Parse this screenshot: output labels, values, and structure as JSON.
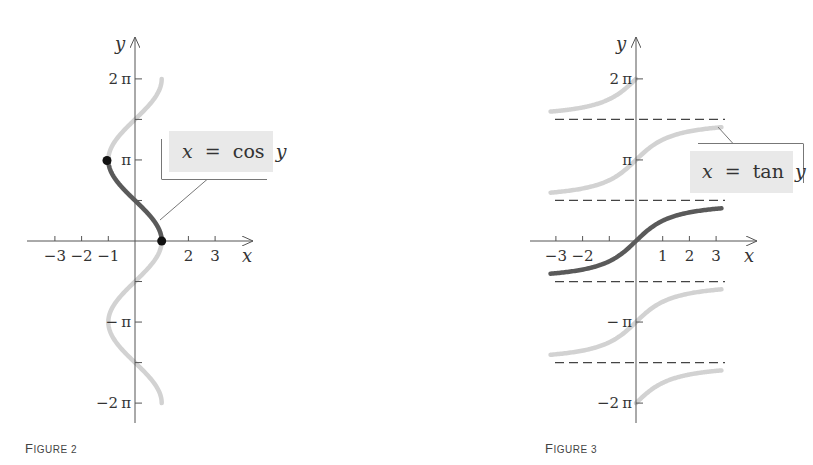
{
  "figures": [
    {
      "id": "figure-2",
      "caption": {
        "first": "F",
        "rest": "IGURE 2"
      },
      "equation": {
        "lhs": "x",
        "eq": "=",
        "func": "cos",
        "var": "y"
      }
    },
    {
      "id": "figure-3",
      "caption": {
        "first": "F",
        "rest": "IGURE 3"
      },
      "equation": {
        "lhs": "x",
        "eq": "=",
        "func": "tan",
        "var": "y"
      }
    }
  ],
  "colors": {
    "axis": "#555555",
    "highlight_curve": "#5a5a5a",
    "faded_curve": "#d2d2d2",
    "label_box": "#e9e9e9",
    "dashed": "#444444",
    "dot": "#111111"
  },
  "chart_data": [
    {
      "type": "line",
      "title": "",
      "caption": "FIGURE 2",
      "xlabel": "x",
      "ylabel": "y",
      "xlim": [
        -4,
        4
      ],
      "ylim": [
        -6.9,
        7.4
      ],
      "x_ticks": [
        -3,
        -2,
        -1,
        1,
        2,
        3
      ],
      "x_tick_labels": [
        "−3",
        "−2",
        "−1",
        "",
        "2",
        "3"
      ],
      "y_ticks": [
        -6.2832,
        -4.7124,
        -3.1416,
        -1.5708,
        1.5708,
        3.1416,
        4.7124,
        6.2832
      ],
      "y_tick_labels": [
        "−2π",
        "",
        "−π",
        "",
        "",
        "π",
        "",
        "2π"
      ],
      "grid": false,
      "series": [
        {
          "name": "x = cos y (full)",
          "style": "faded",
          "function": "x = cos(y)",
          "y_range": [
            -6.2832,
            6.2832
          ]
        },
        {
          "name": "x = cos y, 0 ≤ y ≤ π (inverse cosine)",
          "style": "highlight",
          "function": "x = cos(y)",
          "y_range": [
            0,
            3.1416
          ]
        }
      ],
      "points": [
        {
          "x": -1,
          "y": 3.1416,
          "label": "(−1, π)"
        },
        {
          "x": 1,
          "y": 0,
          "label": "(1, 0)"
        }
      ],
      "annotations": [
        {
          "text": "x = cos y",
          "points_to": "curve"
        }
      ]
    },
    {
      "type": "line",
      "title": "",
      "caption": "FIGURE 3",
      "xlabel": "x",
      "ylabel": "y",
      "xlim": [
        -4,
        4
      ],
      "ylim": [
        -6.9,
        7.4
      ],
      "x_ticks": [
        -3,
        -2,
        -1,
        1,
        2,
        3
      ],
      "x_tick_labels": [
        "−3",
        "−2",
        "",
        "1",
        "2",
        "3"
      ],
      "y_ticks": [
        -6.2832,
        -3.1416,
        3.1416,
        6.2832
      ],
      "y_tick_labels": [
        "−2π",
        "−π",
        "π",
        "2π"
      ],
      "grid": false,
      "asymptotes_y": [
        -4.7124,
        -1.5708,
        1.5708,
        4.7124
      ],
      "series": [
        {
          "name": "x = tan y, branch near 2π",
          "style": "faded",
          "function": "y = arctan(x) + 2π",
          "x_range": [
            -3.2,
            0
          ]
        },
        {
          "name": "x = tan y, branch near π",
          "style": "faded",
          "function": "y = arctan(x) + π",
          "x_range": [
            -3.2,
            3.2
          ]
        },
        {
          "name": "x = tan y, −π/2 < y < π/2 (inverse tangent)",
          "style": "highlight",
          "function": "y = arctan(x)",
          "x_range": [
            -3.2,
            3.2
          ]
        },
        {
          "name": "x = tan y, branch near −π",
          "style": "faded",
          "function": "y = arctan(x) − π",
          "x_range": [
            -3.2,
            3.2
          ]
        },
        {
          "name": "x = tan y, branch near −2π",
          "style": "faded",
          "function": "y = arctan(x) − 2π",
          "x_range": [
            0,
            3.2
          ]
        }
      ],
      "annotations": [
        {
          "text": "x = tan y",
          "points_to": "curve"
        }
      ]
    }
  ]
}
